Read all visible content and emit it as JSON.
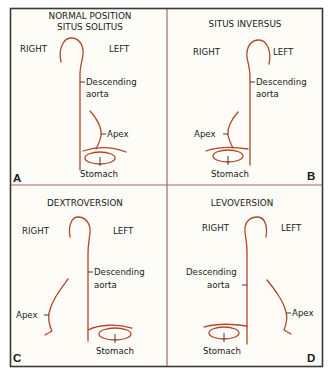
{
  "figure": {
    "background": "#fdfcf6",
    "frame_color": "#3a3a3a",
    "divider_color": "#9c6b6b",
    "curve_color": "#b3452f",
    "panels": [
      {
        "letter": "A",
        "title_line1": "NORMAL POSITION",
        "title_line2": "SITUS SOLITUS",
        "right_label": "RIGHT",
        "left_label": "LEFT",
        "aorta_line1": "Descending",
        "aorta_line2": "aorta",
        "apex_label": "Apex",
        "stomach_label": "Stomach"
      },
      {
        "letter": "B",
        "title_line1": "SITUS INVERSUS",
        "right_label": "RIGHT",
        "left_label": "LEFT",
        "aorta_line1": "Descending",
        "aorta_line2": "aorta",
        "apex_label": "Apex",
        "stomach_label": "Stomach"
      },
      {
        "letter": "C",
        "title_line1": "DEXTROVERSION",
        "right_label": "RIGHT",
        "left_label": "LEFT",
        "aorta_line1": "Descending",
        "aorta_line2": "aorta",
        "apex_label": "Apex",
        "stomach_label": "Stomach"
      },
      {
        "letter": "D",
        "title_line1": "LEVOVERSION",
        "right_label": "RIGHT",
        "left_label": "LEFT",
        "aorta_line1": "Descending",
        "aorta_line2": "aorta",
        "apex_label": "Apex",
        "stomach_label": "Stomach"
      }
    ]
  }
}
